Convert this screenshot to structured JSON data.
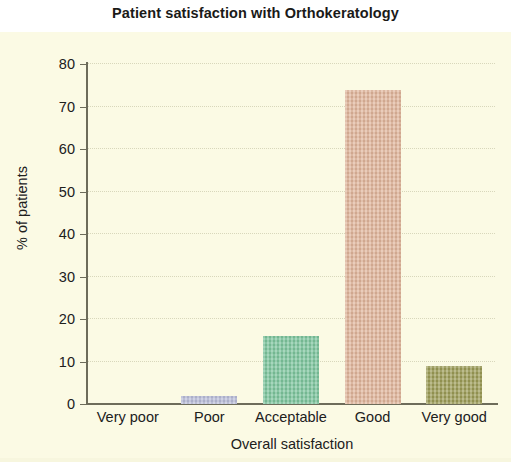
{
  "chart_data": {
    "type": "bar",
    "title": "Patient satisfaction with Orthokeratology",
    "xlabel": "Overall satisfaction",
    "ylabel": "% of patients",
    "categories": [
      "Very poor",
      "Poor",
      "Acceptable",
      "Good",
      "Very good"
    ],
    "values": [
      0,
      2,
      16,
      74,
      9
    ],
    "ylim": [
      0,
      80
    ],
    "ytick_labels": [
      "80",
      "70",
      "60",
      "50",
      "40",
      "30",
      "20",
      "10",
      "0"
    ],
    "ytick_values": [
      80,
      70,
      60,
      50,
      40,
      30,
      20,
      10,
      0
    ],
    "grid": true,
    "grid_style": "dotted horizontal",
    "legend": "none",
    "bar_colors": [
      "#fbfae4",
      "#b8bcd8",
      "#7cc49c",
      "#e0b49a",
      "#9b9b55"
    ],
    "panel_background": "#fbfae4",
    "axis_color": "#6d6c5a",
    "text_color": "#20201c",
    "series": [
      {
        "name": "% of patients",
        "values": [
          0,
          2,
          16,
          74,
          9
        ]
      }
    ]
  }
}
